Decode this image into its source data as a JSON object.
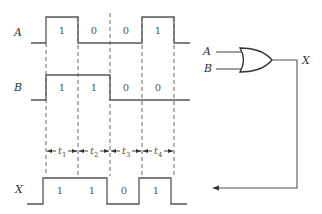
{
  "signals": {
    "A": {
      "label": "A",
      "bits": [
        "1",
        "0",
        "0",
        "1"
      ]
    },
    "B": {
      "label": "B",
      "bits": [
        "1",
        "1",
        "0",
        "0"
      ]
    },
    "X": {
      "label": "X",
      "bits": [
        "1",
        "1",
        "0",
        "1"
      ]
    }
  },
  "intervals": [
    {
      "label": "t",
      "sub": "1"
    },
    {
      "label": "t",
      "sub": "2"
    },
    {
      "label": "t",
      "sub": "3"
    },
    {
      "label": "t",
      "sub": "4"
    }
  ],
  "gate": {
    "type": "OR",
    "input_a_label": "A",
    "input_b_label": "B",
    "output_label": "X"
  },
  "colors": {
    "line": "#555555",
    "background": "#ffffff"
  }
}
